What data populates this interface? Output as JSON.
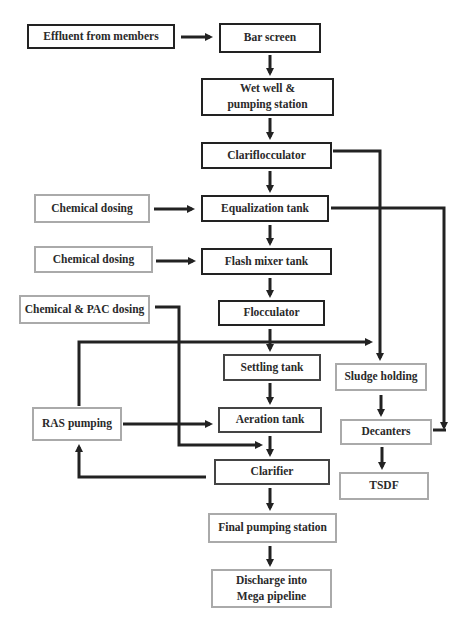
{
  "diagram": {
    "title": "",
    "type": "process-flowchart",
    "colors": {
      "line": "#222222",
      "dark_border": "#222222",
      "light_border": "#aaaaaa",
      "text": "#2a2a2a"
    },
    "nodes": {
      "effluent": "Effluent from members",
      "bar_screen": "Bar screen",
      "wet_well": "Wet well & pumping station",
      "clariflocculator": "Clariflocculator",
      "chem_dosing_1": "Chemical dosing",
      "equalization": "Equalization tank",
      "chem_dosing_2": "Chemical dosing",
      "flash_mixer": "Flash mixer tank",
      "chem_pac": "Chemical & PAC dosing",
      "flocculator": "Flocculator",
      "settling": "Settling tank",
      "sludge_holding": "Sludge holding",
      "ras": "RAS pumping",
      "aeration": "Aeration tank",
      "decanters": "Decanters",
      "clarifier": "Clarifier",
      "tsdf": "TSDF",
      "final_pumping": "Final pumping station",
      "discharge": "Discharge into Mega pipeline"
    },
    "edges": [
      [
        "effluent",
        "bar_screen"
      ],
      [
        "bar_screen",
        "wet_well"
      ],
      [
        "wet_well",
        "clariflocculator"
      ],
      [
        "clariflocculator",
        "equalization"
      ],
      [
        "clariflocculator",
        "sludge_holding"
      ],
      [
        "chem_dosing_1",
        "equalization"
      ],
      [
        "equalization",
        "flash_mixer"
      ],
      [
        "equalization",
        "decanters"
      ],
      [
        "chem_dosing_2",
        "flash_mixer"
      ],
      [
        "flash_mixer",
        "flocculator"
      ],
      [
        "flocculator",
        "settling"
      ],
      [
        "chem_pac",
        "clarifier"
      ],
      [
        "settling",
        "aeration"
      ],
      [
        "ras",
        "aeration"
      ],
      [
        "ras",
        "sludge_holding"
      ],
      [
        "aeration",
        "clarifier"
      ],
      [
        "clarifier",
        "ras"
      ],
      [
        "clarifier",
        "final_pumping"
      ],
      [
        "final_pumping",
        "discharge"
      ],
      [
        "sludge_holding",
        "decanters"
      ],
      [
        "decanters",
        "tsdf"
      ]
    ]
  }
}
